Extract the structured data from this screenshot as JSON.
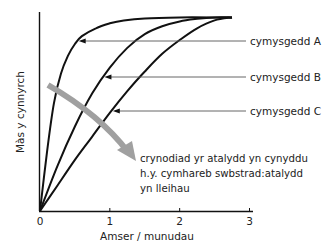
{
  "chart_data": {
    "type": "line",
    "title": "",
    "xlabel": "Amser / munudau",
    "ylabel": "Màs y cynnyrch",
    "xlim": [
      0,
      3
    ],
    "ylim": [
      0,
      1
    ],
    "x_ticks": [
      "0",
      "1",
      "2",
      "3"
    ],
    "y_ticks": [],
    "grid": false,
    "legend": "none",
    "series": [
      {
        "name": "cymysgedd A",
        "x": [
          0,
          0.1,
          0.2,
          0.3,
          0.4,
          0.5,
          0.6,
          0.8,
          1.0,
          1.2,
          1.5,
          2.0,
          2.5,
          2.75
        ],
        "y": [
          0,
          0.3,
          0.55,
          0.7,
          0.79,
          0.85,
          0.89,
          0.93,
          0.955,
          0.97,
          0.98,
          0.985,
          0.985,
          0.985
        ]
      },
      {
        "name": "cymysgedd B",
        "x": [
          0,
          0.25,
          0.5,
          0.75,
          1.0,
          1.25,
          1.5,
          1.75,
          2.0,
          2.25,
          2.5,
          2.75
        ],
        "y": [
          0,
          0.23,
          0.43,
          0.6,
          0.73,
          0.83,
          0.9,
          0.94,
          0.965,
          0.978,
          0.985,
          0.985
        ]
      },
      {
        "name": "cymysgedd C",
        "x": [
          0,
          0.25,
          0.5,
          0.75,
          1.0,
          1.25,
          1.5,
          1.75,
          2.0,
          2.25,
          2.5,
          2.75
        ],
        "y": [
          0,
          0.13,
          0.26,
          0.38,
          0.5,
          0.61,
          0.71,
          0.8,
          0.87,
          0.93,
          0.97,
          0.985
        ]
      }
    ],
    "annotations": [
      {
        "text": "cymysgedd A",
        "points_to": "cymysgedd A"
      },
      {
        "text": "cymysgedd B",
        "points_to": "cymysgedd B"
      },
      {
        "text": "cymysgedd C",
        "points_to": "cymysgedd C"
      }
    ],
    "trend_arrow": {
      "lines": [
        "crynodiad yr atalydd yn cynyddu",
        "h.y. cymhareb swbstrad:atalydd",
        "yn lleihau"
      ],
      "color": "#a0a0a0"
    },
    "colors": {
      "curves": "#111111",
      "axes": "#111111",
      "pointer_lines": "#555555",
      "trend_arrow": "#a0a0a0",
      "text": "#222222"
    }
  }
}
